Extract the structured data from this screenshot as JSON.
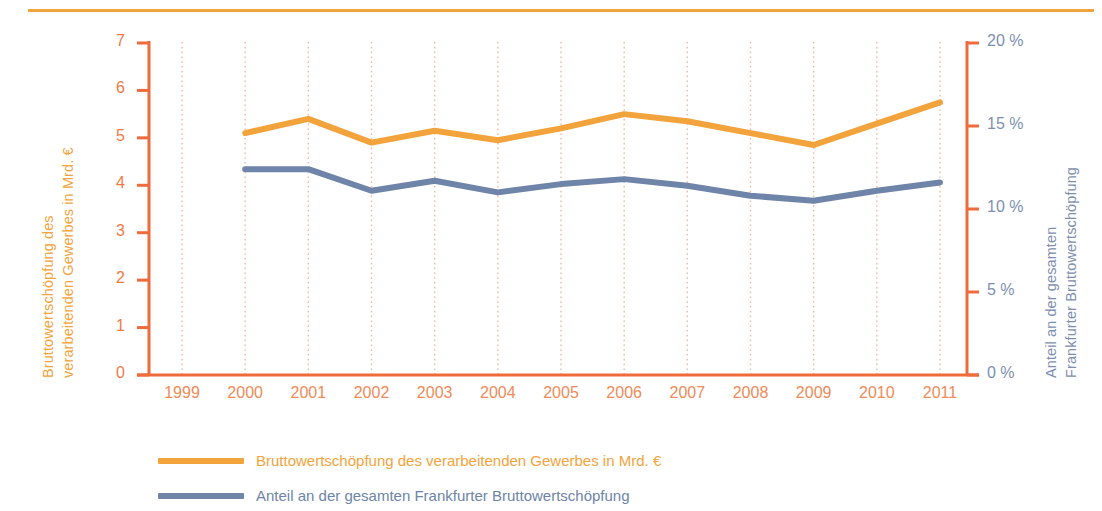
{
  "chart_data": {
    "type": "line",
    "title": "",
    "xlabel": "",
    "categories": [
      "1999",
      "2000",
      "2001",
      "2002",
      "2003",
      "2004",
      "2005",
      "2006",
      "2007",
      "2008",
      "2009",
      "2010",
      "2011"
    ],
    "grid": true,
    "legend_position": "bottom-left",
    "axes": {
      "left": {
        "label": "Bruttowertschöpfung des verarbeitenden Gewerbes in Mrd. €",
        "ticks": [
          "0",
          "1",
          "2",
          "3",
          "4",
          "5",
          "6",
          "7"
        ],
        "tick_values": [
          0,
          1,
          2,
          3,
          4,
          5,
          6,
          7
        ],
        "ylim": [
          0,
          7
        ],
        "color": "#EF7A45"
      },
      "right": {
        "label": "Anteil an der gesamten Frankfurter Bruttowertschöpfung",
        "ticks": [
          "0 %",
          "5 %",
          "10 %",
          "15 %",
          "20 %"
        ],
        "tick_values": [
          0,
          5,
          10,
          15,
          20
        ],
        "ylim": [
          0,
          20
        ],
        "color": "#7C8FAE"
      }
    },
    "series": [
      {
        "name": "Bruttowertschöpfung des verarbeitenden Gewerbes in Mrd. €",
        "axis": "left",
        "color": "#F3A33B",
        "x": [
          "2000",
          "2001",
          "2002",
          "2003",
          "2004",
          "2005",
          "2006",
          "2007",
          "2008",
          "2009",
          "2010",
          "2011"
        ],
        "values": [
          5.1,
          5.4,
          4.9,
          5.15,
          4.95,
          5.2,
          5.5,
          5.35,
          5.1,
          4.85,
          5.3,
          5.75
        ]
      },
      {
        "name": "Anteil an der gesamten Frankfurter Bruttowertschöpfung",
        "axis": "right",
        "color": "#6E84A8",
        "x": [
          "2000",
          "2001",
          "2002",
          "2003",
          "2004",
          "2005",
          "2006",
          "2007",
          "2008",
          "2009",
          "2010",
          "2011"
        ],
        "values": [
          12.4,
          12.4,
          11.1,
          11.7,
          11.0,
          11.5,
          11.8,
          11.4,
          10.8,
          10.5,
          11.1,
          11.6
        ]
      }
    ]
  },
  "legend": {
    "items": [
      {
        "label": "Bruttowertschöpfung des verarbeitenden Gewerbes in Mrd. €",
        "color": "#F3A33B"
      },
      {
        "label": "Anteil an der gesamten Frankfurter Bruttowertschöpfung",
        "color": "#6E84A8"
      }
    ]
  },
  "colors": {
    "orange_series": "#F3A33B",
    "blue_series": "#6E84A8",
    "axis_orange": "#EF6B3C",
    "tick_orange": "#F08A57",
    "blue_text": "#7C8FAE",
    "grid": "#F0B9A0",
    "top_rule": "#F3A33B"
  }
}
